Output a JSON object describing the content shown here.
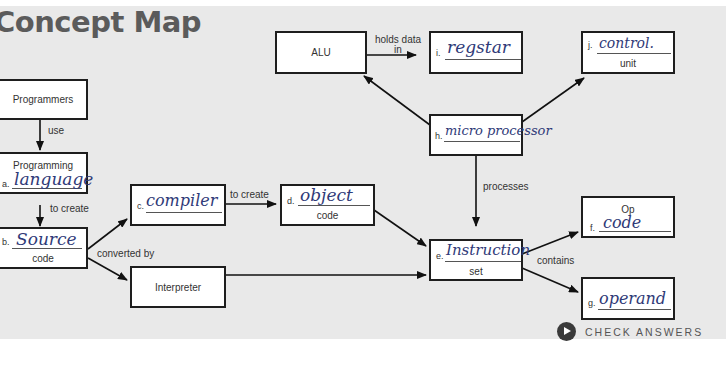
{
  "title": "Concept Map",
  "nodes": {
    "programmers": {
      "label": "Programmers"
    },
    "programming_language": {
      "top_label": "Programming",
      "prefix": "a.",
      "answer": "language"
    },
    "source_code": {
      "prefix": "b.",
      "answer": "Source",
      "bottom_label": "code"
    },
    "compiler": {
      "prefix": "c.",
      "answer": "compiler"
    },
    "object_code": {
      "prefix": "d.",
      "answer": "object",
      "bottom_label": "code"
    },
    "interpreter": {
      "label": "Interpreter"
    },
    "instruction_set": {
      "prefix": "e.",
      "answer": "Instruction",
      "bottom_label": "set"
    },
    "op_code": {
      "top_label": "Op",
      "prefix": "f.",
      "answer": "code"
    },
    "operand": {
      "prefix": "g.",
      "answer": "operand"
    },
    "microprocessor": {
      "prefix": "h.",
      "answer": "micro processor"
    },
    "register": {
      "prefix": "i.",
      "answer": "regstar"
    },
    "control_unit": {
      "prefix": "j.",
      "answer": "control.",
      "bottom_label": "unit"
    },
    "alu": {
      "label": "ALU"
    }
  },
  "edges": {
    "use": "use",
    "to_create_1": "to create",
    "to_create_2": "to create",
    "converted_by": "converted by",
    "holds_data_in_1": "holds data",
    "holds_data_in_2": "in",
    "processes": "processes",
    "contains": "contains"
  },
  "check_answers": "CHECK ANSWERS"
}
